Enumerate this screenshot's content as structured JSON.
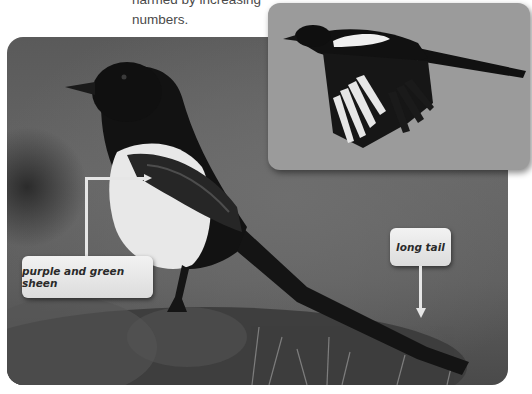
{
  "intro": {
    "lines": [
      "harmed by increasing",
      "numbers."
    ]
  },
  "main_photo": {
    "subject": "magpie perched on grassy mound",
    "tone": "grayscale"
  },
  "inset_photo": {
    "subject": "magpie in flight",
    "background_color": "#9b9b9b"
  },
  "labels": {
    "sheen": "purple and green sheen",
    "tail": "long tail"
  },
  "colors": {
    "label_bg": "#e8e8e8",
    "connector": "#e6e6e6",
    "label_text": "#2a2a2a"
  }
}
